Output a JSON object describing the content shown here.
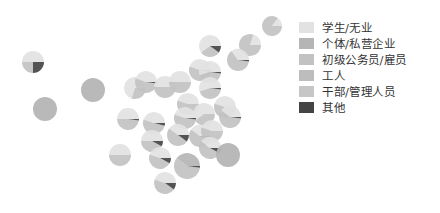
{
  "chart_data": {
    "type": "pie-map",
    "title": "",
    "legend_position": "right",
    "categories": [
      "学生/无业",
      "个体/私营企业",
      "初级公务员/雇员",
      "工人",
      "干部/管理人员",
      "其他"
    ],
    "colors": [
      "#e2e2e2",
      "#b5b5b5",
      "#c2c2c2",
      "#bdbdbd",
      "#c6c6c6",
      "#444444"
    ],
    "pies": [
      {
        "x": 272,
        "y": 26,
        "r": 10,
        "values": [
          15,
          0,
          85,
          0,
          0,
          0
        ]
      },
      {
        "x": 210,
        "y": 46,
        "r": 11,
        "values": [
          60,
          0,
          30,
          0,
          0,
          10
        ]
      },
      {
        "x": 250,
        "y": 45,
        "r": 11,
        "values": [
          20,
          0,
          80,
          0,
          0,
          0
        ]
      },
      {
        "x": 238,
        "y": 60,
        "r": 11,
        "values": [
          35,
          0,
          63,
          0,
          0,
          2
        ]
      },
      {
        "x": 200,
        "y": 70,
        "r": 11,
        "values": [
          45,
          0,
          53,
          0,
          0,
          2
        ]
      },
      {
        "x": 210,
        "y": 72,
        "r": 11,
        "values": [
          55,
          0,
          43,
          0,
          0,
          2
        ]
      },
      {
        "x": 210,
        "y": 88,
        "r": 11,
        "values": [
          55,
          0,
          43,
          0,
          0,
          2
        ]
      },
      {
        "x": 33,
        "y": 62,
        "r": 11,
        "values": [
          50,
          0,
          25,
          0,
          0,
          25
        ]
      },
      {
        "x": 93,
        "y": 90,
        "r": 12,
        "values": [
          0,
          100,
          0,
          0,
          0,
          0
        ]
      },
      {
        "x": 45,
        "y": 109,
        "r": 12,
        "values": [
          0,
          100,
          0,
          0,
          0,
          0
        ]
      },
      {
        "x": 135,
        "y": 88,
        "r": 11,
        "values": [
          70,
          0,
          30,
          0,
          0,
          0
        ]
      },
      {
        "x": 146,
        "y": 82,
        "r": 11,
        "values": [
          45,
          0,
          53,
          0,
          0,
          2
        ]
      },
      {
        "x": 165,
        "y": 87,
        "r": 11,
        "values": [
          50,
          0,
          50,
          0,
          0,
          0
        ]
      },
      {
        "x": 180,
        "y": 82,
        "r": 11,
        "values": [
          50,
          0,
          50,
          0,
          0,
          0
        ]
      },
      {
        "x": 188,
        "y": 104,
        "r": 11,
        "values": [
          45,
          0,
          55,
          0,
          0,
          0
        ]
      },
      {
        "x": 204,
        "y": 114,
        "r": 11,
        "values": [
          60,
          0,
          40,
          0,
          0,
          0
        ]
      },
      {
        "x": 225,
        "y": 107,
        "r": 11,
        "values": [
          45,
          0,
          55,
          0,
          0,
          0
        ]
      },
      {
        "x": 230,
        "y": 117,
        "r": 11,
        "values": [
          40,
          0,
          58,
          0,
          0,
          2
        ]
      },
      {
        "x": 128,
        "y": 119,
        "r": 11,
        "values": [
          50,
          0,
          48,
          0,
          0,
          2
        ]
      },
      {
        "x": 154,
        "y": 123,
        "r": 11,
        "values": [
          45,
          0,
          51,
          0,
          0,
          4
        ]
      },
      {
        "x": 185,
        "y": 118,
        "r": 11,
        "values": [
          45,
          0,
          53,
          0,
          0,
          2
        ]
      },
      {
        "x": 178,
        "y": 135,
        "r": 11,
        "values": [
          40,
          0,
          50,
          0,
          0,
          10
        ]
      },
      {
        "x": 152,
        "y": 141,
        "r": 11,
        "values": [
          50,
          0,
          42,
          0,
          0,
          8
        ]
      },
      {
        "x": 200,
        "y": 136,
        "r": 11,
        "values": [
          40,
          0,
          58,
          0,
          0,
          2
        ]
      },
      {
        "x": 212,
        "y": 131,
        "r": 11,
        "values": [
          45,
          0,
          55,
          0,
          0,
          0
        ]
      },
      {
        "x": 210,
        "y": 148,
        "r": 11,
        "values": [
          40,
          0,
          52,
          0,
          0,
          8
        ]
      },
      {
        "x": 228,
        "y": 155,
        "r": 12,
        "values": [
          0,
          100,
          0,
          0,
          0,
          0
        ]
      },
      {
        "x": 120,
        "y": 155,
        "r": 11,
        "values": [
          50,
          0,
          50,
          0,
          0,
          0
        ]
      },
      {
        "x": 160,
        "y": 158,
        "r": 11,
        "values": [
          45,
          0,
          47,
          0,
          0,
          8
        ]
      },
      {
        "x": 187,
        "y": 166,
        "r": 13,
        "values": [
          0,
          40,
          58,
          0,
          0,
          2
        ]
      },
      {
        "x": 165,
        "y": 183,
        "r": 11,
        "values": [
          45,
          0,
          45,
          0,
          0,
          10
        ]
      }
    ]
  },
  "legend": {
    "items": [
      {
        "label": "学生/无业",
        "color": "#e2e2e2"
      },
      {
        "label": "个体/私营企业",
        "color": "#b5b5b5"
      },
      {
        "label": "初级公务员/雇员",
        "color": "#c2c2c2"
      },
      {
        "label": "工人",
        "color": "#bdbdbd"
      },
      {
        "label": "干部/管理人员",
        "color": "#c6c6c6"
      },
      {
        "label": "其他",
        "color": "#444444"
      }
    ]
  }
}
